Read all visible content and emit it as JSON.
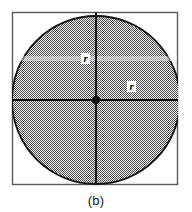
{
  "figure": {
    "caption": "(b)",
    "background_color": "#ffffff",
    "border_color": "#5a5a5a",
    "outline_color": "#141414",
    "fill_color": "#9a9a9a",
    "axis_color": "#111111",
    "labels": {
      "radius_vertical": "r",
      "radius_diagonal": "r"
    },
    "geometry": {
      "square": {
        "x": 12,
        "y": 12,
        "width": 166,
        "height": 173
      },
      "circle": {
        "cx": 96,
        "cy": 100,
        "r": 84
      },
      "center_dot_radius": 4,
      "vertical_axis_x": 96,
      "horizontal_axis_y": 100
    }
  }
}
